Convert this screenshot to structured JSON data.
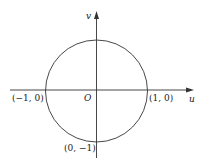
{
  "diagram": {
    "type": "unit-circle-uv-plane",
    "axes": {
      "horizontal_label": "u",
      "vertical_label": "v",
      "origin_label": "O"
    },
    "points": [
      {
        "name": "left-intercept",
        "label": "(−1, 0)"
      },
      {
        "name": "right-intercept",
        "label": "(1, 0)"
      },
      {
        "name": "bottom-intercept",
        "label": "(0, −1)"
      }
    ],
    "colors": {
      "stroke": "#333333",
      "background": "#ffffff"
    }
  }
}
